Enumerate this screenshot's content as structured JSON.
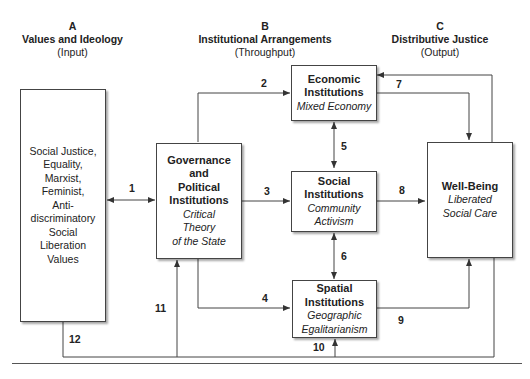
{
  "columns": [
    {
      "letter": "A",
      "title": "Values and Ideology",
      "sub": "(Input)"
    },
    {
      "letter": "B",
      "title": "Institutional Arrangements",
      "sub": "(Throughput)"
    },
    {
      "letter": "C",
      "title": "Distributive Justice",
      "sub": "(Output)"
    }
  ],
  "boxes": {
    "values": {
      "lines": [
        "Social Justice,",
        "Equality,",
        "Marxist,",
        "Feminist,",
        "Anti-",
        "discriminatory",
        "Social",
        "Liberation",
        "Values"
      ]
    },
    "governance": {
      "bold": [
        "Governance",
        "and",
        "Political",
        "Institutions"
      ],
      "italic": [
        "Critical",
        "Theory",
        "of the State"
      ]
    },
    "economic": {
      "bold": [
        "Economic",
        "Institutions"
      ],
      "italic": [
        "Mixed Economy"
      ]
    },
    "social": {
      "bold": [
        "Social",
        "Institutions"
      ],
      "italic": [
        "Community",
        "Activism"
      ]
    },
    "spatial": {
      "bold": [
        "Spatial",
        "Institutions"
      ],
      "italic": [
        "Geographic",
        "Egalitarianism"
      ]
    },
    "wellbeing": {
      "bold": [
        "Well-Being"
      ],
      "italic": [
        "Liberated",
        "Social Care"
      ]
    }
  },
  "arrow_labels": [
    "1",
    "2",
    "3",
    "4",
    "5",
    "6",
    "7",
    "8",
    "9",
    "10",
    "11",
    "12"
  ],
  "colors": {
    "line": "#444444",
    "text": "#222222",
    "background": "#ffffff"
  }
}
